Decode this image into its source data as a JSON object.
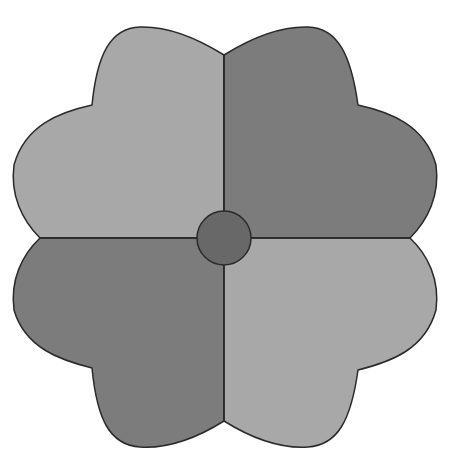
{
  "figure": {
    "type": "four-quadrant flower shape",
    "quadrants": [
      {
        "position": "top-left",
        "shade": "light",
        "color": "#a8a8a8"
      },
      {
        "position": "top-right",
        "shade": "dark",
        "color": "#7c7c7c"
      },
      {
        "position": "bottom-left",
        "shade": "dark",
        "color": "#7c7c7c"
      },
      {
        "position": "bottom-right",
        "shade": "light",
        "color": "#a8a8a8"
      }
    ],
    "center_circle": {
      "color": "#686868"
    },
    "outline_color": "#2a2a2a"
  }
}
